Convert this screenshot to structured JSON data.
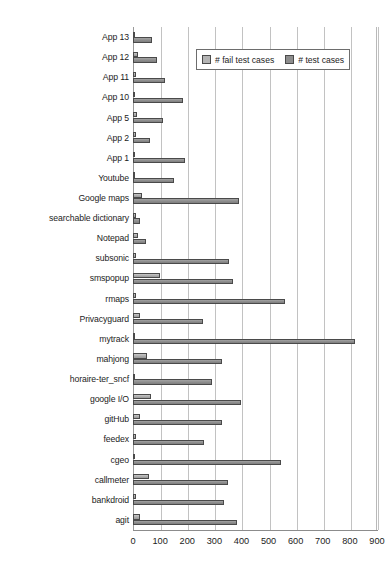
{
  "chart_data": {
    "type": "bar",
    "orientation": "horizontal",
    "title": "",
    "xlabel": "",
    "ylabel": "",
    "xlim": [
      0,
      900
    ],
    "xticks": [
      0,
      100,
      200,
      300,
      400,
      500,
      600,
      700,
      800,
      900
    ],
    "grid": true,
    "legend_position": "top-right",
    "categories": [
      "App 13",
      "App 12",
      "App 11",
      "App 10",
      "App 5",
      "App 2",
      "App 1",
      "Youtube",
      "Google maps",
      "searchable dictionary",
      "Notepad",
      "subsonic",
      "smspopup",
      "rmaps",
      "Privacyguard",
      "mytrack",
      "mahjong",
      "horaire-ter_sncf",
      "google I/O",
      "gitHub",
      "feedex",
      "cgeo",
      "callmeter",
      "bankdroid",
      "agit"
    ],
    "series": [
      {
        "name": "# fail test cases",
        "color": "#b4b4b4",
        "values": [
          5,
          18,
          12,
          5,
          14,
          10,
          5,
          6,
          35,
          10,
          20,
          10,
          100,
          12,
          27,
          5,
          50,
          8,
          68,
          25,
          12,
          5,
          58,
          10,
          25
        ]
      },
      {
        "name": "# test cases",
        "color": "#8d8d8d",
        "values": [
          70,
          88,
          118,
          185,
          110,
          62,
          190,
          150,
          390,
          27,
          47,
          355,
          370,
          560,
          260,
          820,
          330,
          290,
          400,
          330,
          262,
          545,
          352,
          335,
          382
        ]
      }
    ]
  },
  "legend": {
    "items": [
      {
        "label": "# fail test cases",
        "swatch": "fail"
      },
      {
        "label": "# test cases",
        "swatch": "total"
      }
    ]
  }
}
